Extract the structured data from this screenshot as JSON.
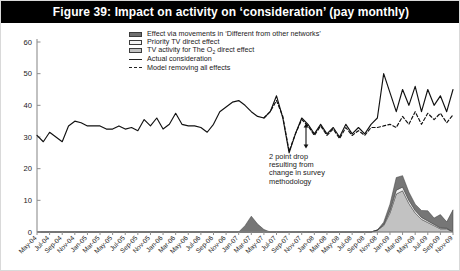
{
  "figure": {
    "title": "Figure 39: Impact on activity on ‘consideration’ (pay monthly)"
  },
  "legend": {
    "items": [
      {
        "label": "Effect via movements in ‘Different from other networks’",
        "swatch": "dark",
        "color": "#6f6f6f"
      },
      {
        "label": "Priority TV direct effect",
        "swatch": "light",
        "color": "#f4f4f4"
      },
      {
        "label": "TV activity for The O  direct effect",
        "swatch": "mid",
        "color": "#c2c2c2"
      },
      {
        "label": "Actual consideration",
        "swatch": "solidline",
        "color": "#222222"
      },
      {
        "label": "Model removing all effects",
        "swatch": "dashline",
        "color": "#222222"
      }
    ]
  },
  "annotation": {
    "lines": [
      "2 point drop",
      "resulting from",
      "change in survey",
      "methodology"
    ],
    "arrow_name": "two-point-drop-arrow"
  },
  "chart_data": {
    "type": "line",
    "title": "Figure 39: Impact on activity on ‘consideration’ (pay monthly)",
    "xlabel": "",
    "ylabel": "",
    "ylim": [
      0,
      60
    ],
    "yticks": [
      0,
      10,
      20,
      30,
      40,
      50,
      60
    ],
    "grid": false,
    "legend_position": "top-center",
    "x": [
      "May-04",
      "Jun-04",
      "Jul-04",
      "Aug-04",
      "Sep-04",
      "Oct-04",
      "Nov-04",
      "Dec-04",
      "Jan-05",
      "Feb-05",
      "Mar-05",
      "Apr-05",
      "May-05",
      "Jun-05",
      "Jul-05",
      "Aug-05",
      "Sep-05",
      "Oct-05",
      "Nov-05",
      "Dec-05",
      "Jan-06",
      "Feb-06",
      "Mar-06",
      "Apr-06",
      "May-06",
      "Jun-06",
      "Jul-06",
      "Aug-06",
      "Sep-06",
      "Oct-06",
      "Nov-06",
      "Dec-06",
      "Jan-07",
      "Feb-07",
      "Mar-07",
      "Apr-07",
      "May-07",
      "Jun-07",
      "Jul-07",
      "Aug-07",
      "Sep-07",
      "Oct-07",
      "Nov-07",
      "Dec-07",
      "Jan-08",
      "Feb-08",
      "Mar-08",
      "Apr-08",
      "May-08",
      "Jun-08",
      "Jul-08",
      "Aug-08",
      "Sep-08",
      "Oct-08",
      "Nov-08",
      "Dec-08",
      "Jan-09",
      "Feb-09",
      "Mar-09",
      "Apr-09",
      "May-09",
      "Jun-09",
      "Jul-09",
      "Aug-09",
      "Sep-09",
      "Oct-09",
      "Nov-09"
    ],
    "tick_labels": [
      "May-04",
      "Jul-04",
      "Sep-04",
      "Nov-04",
      "Jan-05",
      "Mar-05",
      "May-05",
      "Jul-05",
      "Sep-05",
      "Nov-05",
      "Jan-06",
      "Mar-06",
      "May-06",
      "Jul-06",
      "Sep-06",
      "Nov-06",
      "Jan-07",
      "Mar-07",
      "May-07",
      "Jul-07",
      "Sep-07",
      "Nov-07",
      "Jan-08",
      "Mar-08",
      "May-08",
      "Jul-08",
      "Sep-08",
      "Nov-08",
      "Jan-09",
      "Mar-09",
      "May-09",
      "Jul-09",
      "Sep-09",
      "Nov-09"
    ],
    "tick_indices": [
      0,
      2,
      4,
      6,
      8,
      10,
      12,
      14,
      16,
      18,
      20,
      22,
      24,
      26,
      28,
      30,
      32,
      34,
      36,
      38,
      40,
      42,
      44,
      46,
      48,
      50,
      52,
      54,
      56,
      58,
      60,
      62,
      64,
      66
    ],
    "series": [
      {
        "name": "Actual consideration",
        "kind": "line",
        "style": "solid",
        "color": "#111111",
        "values": [
          30.5,
          28.5,
          31.5,
          30.0,
          28.5,
          33.5,
          35.0,
          34.5,
          33.5,
          33.5,
          33.5,
          32.5,
          32.5,
          33.5,
          32.5,
          33.0,
          32.0,
          35.5,
          33.5,
          36.0,
          32.5,
          34.0,
          37.5,
          34.0,
          33.5,
          33.5,
          33.0,
          31.5,
          34.0,
          38.0,
          39.5,
          41.0,
          41.5,
          40.0,
          38.0,
          36.5,
          36.0,
          38.0,
          43.0,
          36.0,
          25.0,
          31.0,
          36.0,
          34.0,
          31.0,
          34.0,
          31.0,
          33.0,
          30.0,
          34.0,
          31.0,
          33.0,
          31.0,
          34.0,
          36.0,
          50.0,
          44.0,
          38.0,
          45.0,
          40.0,
          46.0,
          38.0,
          45.0,
          40.0,
          43.0,
          38.0,
          45.0
        ]
      },
      {
        "name": "Model removing all effects",
        "kind": "line",
        "style": "dashed",
        "color": "#111111",
        "values": [
          null,
          null,
          null,
          null,
          null,
          null,
          null,
          null,
          null,
          null,
          null,
          null,
          null,
          null,
          null,
          null,
          null,
          null,
          null,
          null,
          null,
          null,
          null,
          null,
          null,
          null,
          null,
          null,
          null,
          null,
          null,
          null,
          null,
          null,
          null,
          null,
          36.0,
          38.0,
          41.5,
          36.5,
          25.5,
          31.0,
          35.5,
          33.5,
          30.5,
          33.5,
          30.5,
          32.5,
          29.5,
          33.0,
          30.5,
          32.0,
          30.5,
          33.0,
          33.0,
          33.5,
          34.0,
          33.0,
          36.5,
          34.0,
          38.0,
          34.0,
          37.5,
          35.5,
          37.5,
          34.5,
          37.0
        ]
      },
      {
        "name": "TV activity for The O2 direct effect",
        "kind": "area",
        "stack": 1,
        "color": "#c2c2c2",
        "values": [
          0,
          0,
          0,
          0,
          0,
          0,
          0,
          0,
          0,
          0,
          0,
          0,
          0,
          0,
          0,
          0,
          0,
          0,
          0,
          0,
          0,
          0,
          0,
          0,
          0,
          0,
          0,
          0,
          0,
          0,
          0,
          0,
          0,
          0,
          0,
          0,
          0,
          0,
          0,
          0,
          0,
          0,
          0,
          0,
          0,
          0,
          0,
          0,
          0,
          0,
          0,
          0,
          0,
          0,
          0.6,
          2.0,
          6.0,
          12.0,
          13.0,
          9.0,
          6.0,
          4.0,
          3.0,
          2.0,
          1.0,
          1.0,
          0.0
        ]
      },
      {
        "name": "Priority TV direct effect",
        "kind": "area",
        "stack": 2,
        "color": "#f2f2f2",
        "values": [
          0,
          0,
          0,
          0,
          0,
          0,
          0,
          0,
          0,
          0,
          0,
          0,
          0,
          0,
          0,
          0,
          0,
          0,
          0,
          0,
          0,
          0,
          0,
          0,
          0,
          0,
          0,
          0,
          0,
          0,
          0,
          0,
          0,
          0,
          0,
          0,
          0,
          0,
          0,
          0,
          0,
          0,
          0,
          0,
          0,
          0,
          0,
          0,
          0,
          0,
          0,
          0,
          0,
          0,
          0,
          0.3,
          0.8,
          1.2,
          1.2,
          1.0,
          0.8,
          0.6,
          0.5,
          0.4,
          0.3,
          0.2,
          0.0
        ]
      },
      {
        "name": "Effect via movements in 'Different from other networks'",
        "kind": "area",
        "stack": 3,
        "color": "#767676",
        "values": [
          0,
          0,
          0,
          0,
          0,
          0,
          0,
          0,
          0,
          0,
          0,
          0,
          0,
          0,
          0,
          0,
          0,
          0,
          0,
          0,
          0,
          0,
          0,
          0,
          0,
          0,
          0,
          0,
          0,
          0,
          0,
          0,
          0,
          2.0,
          5.0,
          2.5,
          0.8,
          0,
          0,
          0,
          0,
          0,
          0,
          0,
          0,
          0,
          0,
          0,
          0,
          0,
          0,
          0,
          0,
          0,
          0,
          0.8,
          2.0,
          4.0,
          3.6,
          2.6,
          2.0,
          2.2,
          3.2,
          2.0,
          4.2,
          2.0,
          7.0
        ]
      }
    ]
  }
}
